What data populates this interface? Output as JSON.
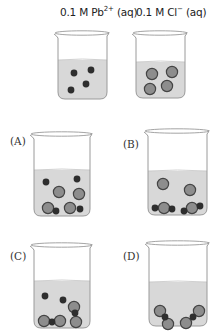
{
  "headers": [
    {
      "prefix": "0.1 M Pb",
      "sup": "2+",
      "suffix": " (aq)",
      "x": 60,
      "y": 5
    },
    {
      "prefix": "0.1 M Cl",
      "sup": "−",
      "suffix": " (aq)",
      "x": 136,
      "y": 5
    }
  ],
  "colors": {
    "liquid": "#d8d8d8",
    "glass": "#9a9a9a",
    "small_ion": "#2e2e2e",
    "large_ion_fill": "#8d8d8d",
    "large_ion_stroke": "#444444"
  },
  "beakers": [
    {
      "id": "pb-solution",
      "label": "",
      "x": 56,
      "y": 32,
      "w": 52,
      "h": 67,
      "liquid_top": 60,
      "small": [
        [
          74,
          73
        ],
        [
          91,
          70
        ],
        [
          86,
          84
        ],
        [
          71,
          90
        ]
      ],
      "large": []
    },
    {
      "id": "cl-solution",
      "label": "",
      "x": 134,
      "y": 32,
      "w": 52,
      "h": 66,
      "liquid_top": 62,
      "small": [],
      "large": [
        [
          152,
          74
        ],
        [
          172,
          72
        ],
        [
          150,
          89
        ],
        [
          167,
          86
        ]
      ]
    },
    {
      "id": "option-a",
      "label": "(A)",
      "label_x": 10,
      "label_y": 135,
      "x": 32,
      "y": 133,
      "w": 59,
      "h": 83,
      "liquid_top": 170,
      "small": [
        [
          46,
          182
        ],
        [
          77,
          179
        ],
        [
          56,
          211
        ],
        [
          80,
          209
        ]
      ],
      "large": [
        [
          59,
          192
        ],
        [
          79,
          194
        ],
        [
          48,
          208
        ],
        [
          70,
          208
        ]
      ]
    },
    {
      "id": "option-b",
      "label": "(B)",
      "label_x": 123,
      "label_y": 138,
      "x": 146,
      "y": 130,
      "w": 62,
      "h": 85,
      "liquid_top": 171,
      "small": [
        [
          155,
          208
        ],
        [
          172,
          209
        ],
        [
          184,
          211
        ],
        [
          200,
          206
        ]
      ],
      "large": [
        [
          163,
          184
        ],
        [
          190,
          190
        ],
        [
          164,
          208
        ],
        [
          192,
          208
        ]
      ]
    },
    {
      "id": "option-c",
      "label": "(C)",
      "label_x": 10,
      "label_y": 250,
      "x": 32,
      "y": 244,
      "w": 59,
      "h": 84,
      "liquid_top": 281,
      "small": [
        [
          45,
          296
        ],
        [
          63,
          300
        ],
        [
          75,
          313
        ],
        [
          52,
          322
        ]
      ],
      "large": [
        [
          74,
          307
        ],
        [
          44,
          321
        ],
        [
          60,
          321
        ],
        [
          76,
          322
        ]
      ]
    },
    {
      "id": "option-d",
      "label": "(D)",
      "label_x": 123,
      "label_y": 250,
      "x": 147,
      "y": 242,
      "w": 61,
      "h": 84,
      "liquid_top": 282,
      "small": [
        [
          165,
          317
        ],
        [
          193,
          317
        ]
      ],
      "large": [
        [
          160,
          311
        ],
        [
          168,
          324
        ],
        [
          186,
          323
        ],
        [
          199,
          311
        ]
      ]
    }
  ]
}
